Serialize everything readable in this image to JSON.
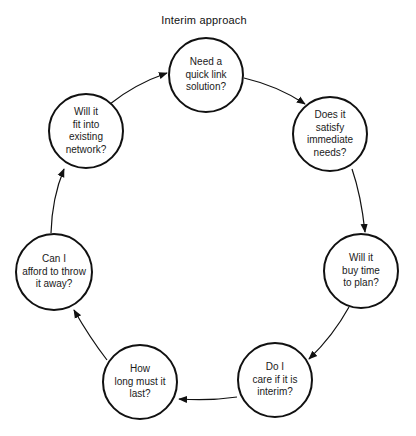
{
  "title": "Interim approach",
  "style": {
    "stroke_color": "#111111",
    "background": "#ffffff"
  },
  "nodes": [
    {
      "id": "n1",
      "label": "Need a\nquick link\nsolution?",
      "cx": 206,
      "cy": 75,
      "r": 38
    },
    {
      "id": "n2",
      "label": "Does it\nsatisfy\nimmediate\nneeds?",
      "cx": 330,
      "cy": 134,
      "r": 38
    },
    {
      "id": "n3",
      "label": "Will it\nbuy time\nto plan?",
      "cx": 361,
      "cy": 271,
      "r": 38
    },
    {
      "id": "n4",
      "label": "Do I\ncare if it is\ninterim?",
      "cx": 275,
      "cy": 380,
      "r": 38
    },
    {
      "id": "n5",
      "label": "How\nlong must it\nlast?",
      "cx": 140,
      "cy": 382,
      "r": 38
    },
    {
      "id": "n6",
      "label": "Can I\nafford to throw\nit away?",
      "cx": 54,
      "cy": 272,
      "r": 39
    },
    {
      "id": "n7",
      "label": "Will it\nfit into\nexisting\nnetwork?",
      "cx": 86,
      "cy": 131,
      "r": 38
    }
  ],
  "edges": [
    {
      "from": "n1",
      "to": "n2"
    },
    {
      "from": "n2",
      "to": "n3"
    },
    {
      "from": "n3",
      "to": "n4"
    },
    {
      "from": "n4",
      "to": "n5"
    },
    {
      "from": "n5",
      "to": "n6"
    },
    {
      "from": "n6",
      "to": "n7"
    },
    {
      "from": "n7",
      "to": "n1"
    }
  ]
}
